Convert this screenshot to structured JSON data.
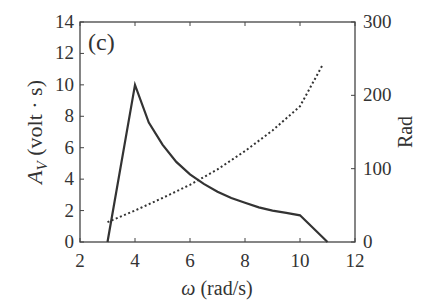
{
  "chart_data": {
    "type": "line",
    "panel_label": "(c)",
    "xlabel": "ω (rad/s)",
    "ylabel_left": "A_V (volt · s)",
    "ylabel_right": "Rad",
    "xlim": [
      2,
      12
    ],
    "ylim_left": [
      0,
      14
    ],
    "ylim_right": [
      0,
      300
    ],
    "x_ticks": [
      "2",
      "4",
      "6",
      "8",
      "10",
      "12"
    ],
    "y_ticks_left": [
      "0",
      "2",
      "4",
      "6",
      "8",
      "10",
      "12",
      "14"
    ],
    "y_ticks_right": [
      "0",
      "100",
      "200",
      "300"
    ],
    "grid": false,
    "series": [
      {
        "name": "A_V",
        "axis": "left",
        "style": "solid",
        "x": [
          3,
          4,
          4.5,
          5,
          5.5,
          6,
          6.5,
          7,
          7.5,
          8,
          8.5,
          9,
          9.5,
          10,
          11
        ],
        "values": [
          0,
          10,
          7.6,
          6.2,
          5.1,
          4.3,
          3.7,
          3.2,
          2.8,
          2.5,
          2.2,
          2.0,
          1.85,
          1.7,
          0
        ]
      },
      {
        "name": "Rad",
        "axis": "right",
        "style": "dotted",
        "x": [
          3,
          4,
          5,
          6,
          7,
          8,
          9,
          10,
          10.8
        ],
        "values": [
          27,
          43,
          60,
          78,
          99,
          124,
          152,
          185,
          240
        ]
      }
    ]
  }
}
